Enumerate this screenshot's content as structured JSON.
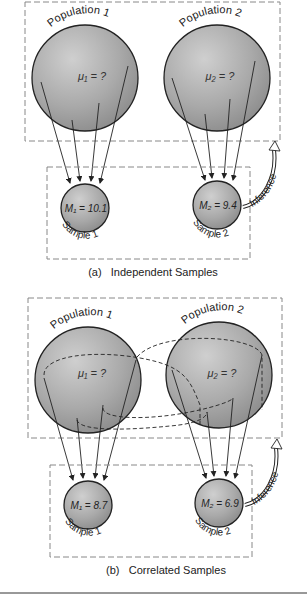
{
  "panels": [
    {
      "id": "a",
      "caption": "(a)   Independent Samples",
      "population_1": {
        "label": "Population 1",
        "parameter": "μ₁ = ?"
      },
      "population_2": {
        "label": "Population 2",
        "parameter": "μ₂ = ?"
      },
      "sample_1": {
        "label": "Sample 1",
        "statistic": "M₁ = 10.1"
      },
      "sample_2": {
        "label": "Sample 2",
        "statistic": "M₂ = 9.4"
      },
      "inference_label": "Inference"
    },
    {
      "id": "b",
      "caption": "(b)   Correlated Samples",
      "population_1": {
        "label": "Population 1",
        "parameter": "μ₁ = ?"
      },
      "population_2": {
        "label": "Population 2",
        "parameter": "μ₂ = ?"
      },
      "sample_1": {
        "label": "Sample 1",
        "statistic": "M₁ = 8.7"
      },
      "sample_2": {
        "label": "Sample 2",
        "statistic": "M₂ = 6.9"
      },
      "inference_label": "Inference"
    }
  ],
  "colors": {
    "sphere_light": "#c8c8c8",
    "sphere_dark": "#8a8a8a",
    "outline": "#222222",
    "dashed_box": "#888888"
  }
}
